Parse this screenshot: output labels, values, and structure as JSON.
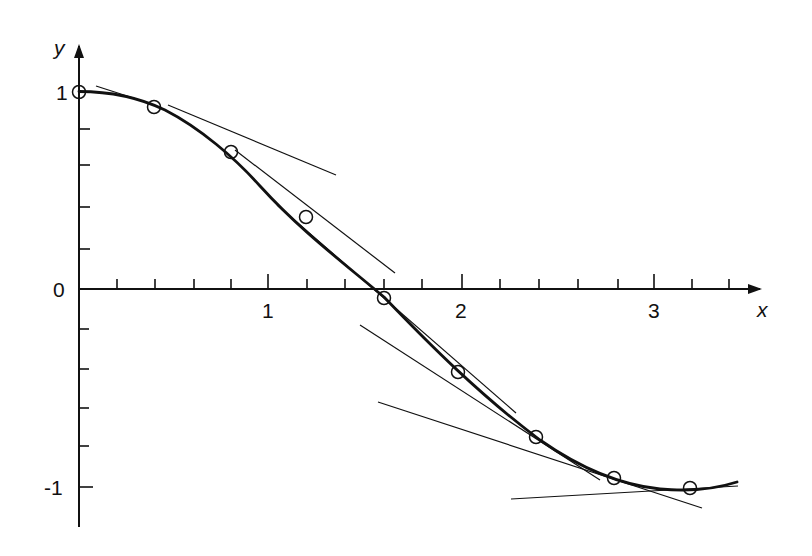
{
  "diagram": {
    "type": "function-plot-with-tangents",
    "function": "cos(x)",
    "axes": {
      "x_label": "x",
      "y_label": "y",
      "x_ticks": [
        "1",
        "2",
        "3"
      ],
      "y_ticks": [
        "1",
        "0",
        "-1"
      ],
      "x_minor_per_unit": 5,
      "y_minor_per_unit": 5
    },
    "sample_points": [
      {
        "x": 0.0,
        "y": 1.0
      },
      {
        "x": 0.4,
        "y": 0.92
      },
      {
        "x": 0.8,
        "y": 0.7
      },
      {
        "x": 1.2,
        "y": 0.36
      },
      {
        "x": 1.6,
        "y": -0.03
      },
      {
        "x": 2.0,
        "y": -0.42
      },
      {
        "x": 2.4,
        "y": -0.74
      },
      {
        "x": 2.8,
        "y": -0.94
      },
      {
        "x": 3.2,
        "y": -1.0
      }
    ],
    "colors": {
      "ink": "#111111",
      "background": "#ffffff"
    }
  }
}
